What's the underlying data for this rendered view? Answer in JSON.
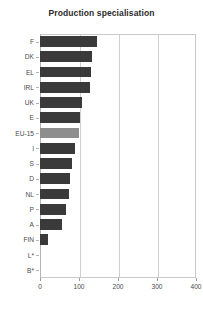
{
  "chart_data": {
    "type": "bar",
    "orientation": "horizontal",
    "title": "Production specialisation",
    "xlabel": "",
    "ylabel": "",
    "xlim": [
      0,
      400
    ],
    "xticks": [
      0,
      100,
      200,
      300,
      400
    ],
    "grid": true,
    "legend": "none",
    "highlight_category": "EU-15",
    "colors": {
      "bar": "#3a3a3a",
      "highlight_bar": "#8e8e8e",
      "gridline": "#cfcfcf",
      "axis": "#b4b4b4",
      "text": "#4a4a4a",
      "title": "#2b2b2b",
      "background": "#ffffff"
    },
    "categories": [
      "F",
      "DK",
      "EL",
      "IRL",
      "UK",
      "E",
      "EU-15",
      "I",
      "S",
      "D",
      "NL",
      "P",
      "A",
      "FIN",
      "L*",
      "B*"
    ],
    "values": [
      146,
      133,
      131,
      128,
      108,
      103,
      100,
      90,
      82,
      77,
      74,
      67,
      56,
      21,
      0,
      0
    ]
  }
}
